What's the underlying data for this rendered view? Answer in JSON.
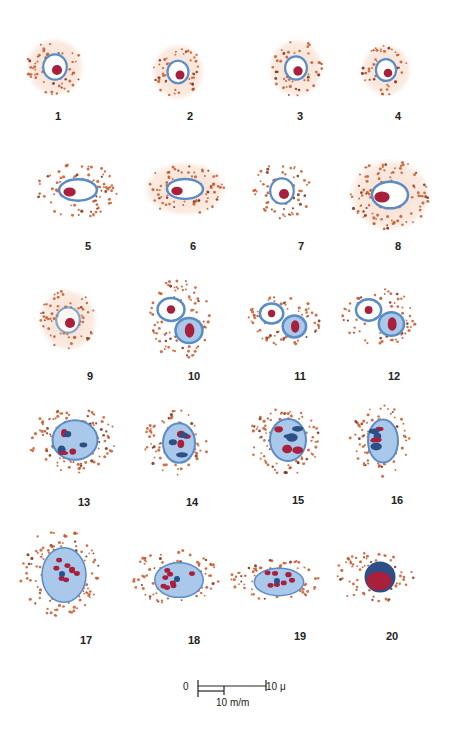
{
  "plate": {
    "colors": {
      "background": "#ffffff",
      "halo": "#f6dccb",
      "granule": "#c8582a",
      "granule_dark": "#7a2a14",
      "nucleus_blue": "#5a8cc8",
      "nucleus_light": "#a9c8ea",
      "nucleus_dark": "#2c4f86",
      "chromatin_red": "#a8203c",
      "label": "#222222"
    },
    "cells": [
      {
        "label": "1",
        "cx": 55,
        "cy": 67,
        "rx": 28,
        "ry": 28,
        "type": "round",
        "halo": true,
        "lx": 58,
        "ly": 112
      },
      {
        "label": "2",
        "cx": 178,
        "cy": 72,
        "rx": 25,
        "ry": 27,
        "type": "round",
        "halo": true,
        "lx": 190,
        "ly": 112
      },
      {
        "label": "3",
        "cx": 296,
        "cy": 68,
        "rx": 26,
        "ry": 28,
        "type": "round",
        "halo": true,
        "lx": 300,
        "ly": 112
      },
      {
        "label": "4",
        "cx": 386,
        "cy": 70,
        "rx": 24,
        "ry": 25,
        "type": "round",
        "halo": true,
        "lx": 398,
        "ly": 112
      },
      {
        "label": "5",
        "cx": 78,
        "cy": 190,
        "rx": 42,
        "ry": 28,
        "type": "oval",
        "halo": false,
        "lx": 88,
        "ly": 242
      },
      {
        "label": "6",
        "cx": 185,
        "cy": 189,
        "rx": 40,
        "ry": 26,
        "type": "oval",
        "halo": true,
        "lx": 193,
        "ly": 242
      },
      {
        "label": "7",
        "cx": 282,
        "cy": 191,
        "rx": 30,
        "ry": 28,
        "type": "round",
        "halo": false,
        "lx": 301,
        "ly": 242
      },
      {
        "label": "8",
        "cx": 390,
        "cy": 195,
        "rx": 40,
        "ry": 35,
        "type": "large",
        "halo": true,
        "lx": 398,
        "ly": 242
      },
      {
        "label": "9",
        "cx": 68,
        "cy": 320,
        "rx": 28,
        "ry": 30,
        "type": "pale",
        "halo": true,
        "lx": 90,
        "ly": 372
      },
      {
        "label": "10",
        "cx": 180,
        "cy": 320,
        "rx": 30,
        "ry": 42,
        "type": "double",
        "halo": false,
        "lx": 194,
        "ly": 372
      },
      {
        "label": "11",
        "cx": 283,
        "cy": 320,
        "rx": 38,
        "ry": 26,
        "type": "double",
        "halo": false,
        "lx": 300,
        "ly": 372
      },
      {
        "label": "12",
        "cx": 380,
        "cy": 317,
        "rx": 38,
        "ry": 28,
        "type": "double",
        "halo": false,
        "lx": 394,
        "ly": 372
      },
      {
        "label": "13",
        "cx": 72,
        "cy": 440,
        "rx": 45,
        "ry": 33,
        "type": "dense",
        "halo": false,
        "lx": 84,
        "ly": 498
      },
      {
        "label": "14",
        "cx": 176,
        "cy": 443,
        "rx": 32,
        "ry": 33,
        "type": "dense",
        "halo": false,
        "lx": 192,
        "ly": 498
      },
      {
        "label": "15",
        "cx": 285,
        "cy": 440,
        "rx": 36,
        "ry": 35,
        "type": "dense",
        "halo": false,
        "lx": 298,
        "ly": 496
      },
      {
        "label": "16",
        "cx": 380,
        "cy": 441,
        "rx": 30,
        "ry": 36,
        "type": "dense",
        "halo": false,
        "lx": 397,
        "ly": 496
      },
      {
        "label": "17",
        "cx": 60,
        "cy": 572,
        "rx": 40,
        "ry": 44,
        "type": "multi",
        "halo": false,
        "lx": 86,
        "ly": 636
      },
      {
        "label": "18",
        "cx": 175,
        "cy": 577,
        "rx": 44,
        "ry": 28,
        "type": "multi",
        "halo": false,
        "lx": 194,
        "ly": 636
      },
      {
        "label": "19",
        "cx": 275,
        "cy": 579,
        "rx": 45,
        "ry": 22,
        "type": "multi",
        "halo": false,
        "lx": 300,
        "ly": 632
      },
      {
        "label": "20",
        "cx": 374,
        "cy": 577,
        "rx": 42,
        "ry": 25,
        "type": "darkround",
        "halo": false,
        "lx": 392,
        "ly": 632
      }
    ]
  },
  "scale_bar": {
    "zero_label": "0",
    "micron_label": "10 μ",
    "mm_label": "10 m/m"
  }
}
